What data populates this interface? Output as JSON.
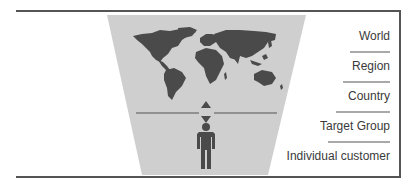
{
  "diagram": {
    "levels": [
      {
        "label": "World"
      },
      {
        "label": "Region"
      },
      {
        "label": "Country"
      },
      {
        "label": "Target Group"
      },
      {
        "label": "Individual customer"
      }
    ],
    "icons": {
      "map": "world-map-icon",
      "arrows": "up-down-arrows-icon",
      "person": "person-icon"
    },
    "colors": {
      "frame": "#555555",
      "funnel": "#cfcfcf",
      "landmass": "#4a4a4a",
      "text": "#3a3a3a",
      "separator": "#555555"
    }
  }
}
